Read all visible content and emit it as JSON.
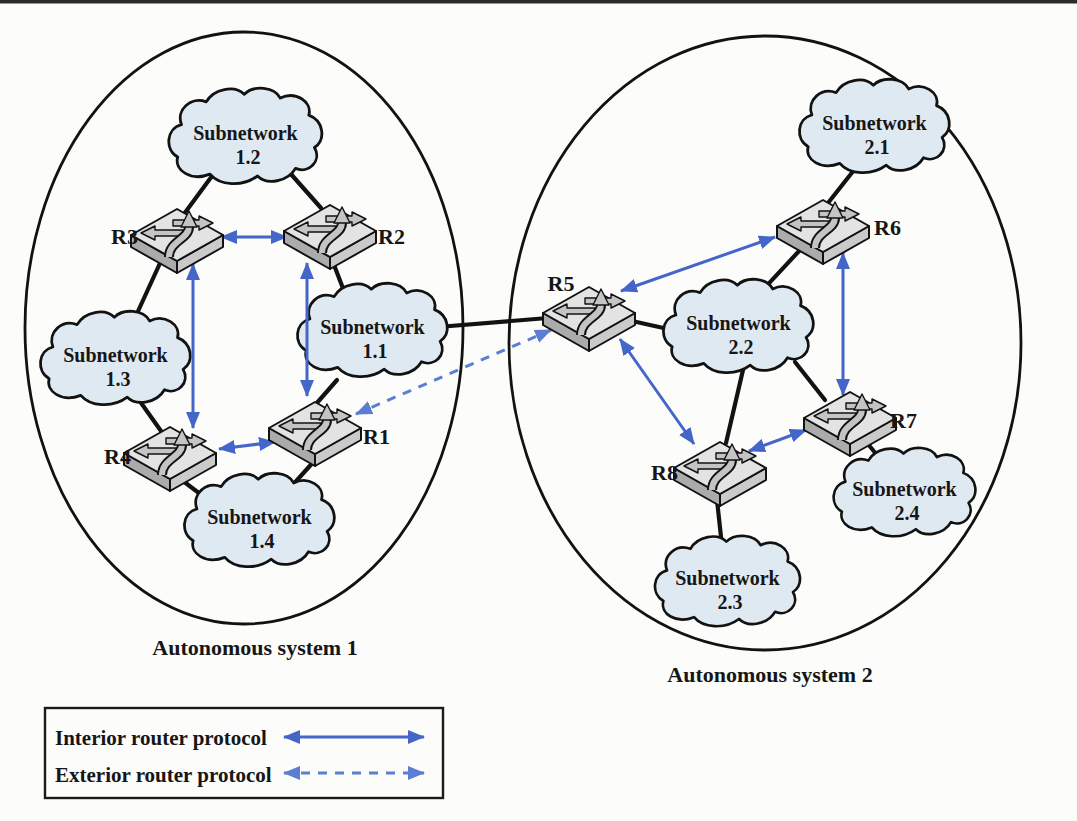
{
  "figure": {
    "type": "network-topology-diagram",
    "description_visible_only": "Two autonomous systems with routers, subnetworks and routing protocol arrows"
  },
  "autonomous_systems": [
    {
      "label": "Autonomous system 1"
    },
    {
      "label": "Autonomous system 2"
    }
  ],
  "routers": {
    "r1": "R1",
    "r2": "R2",
    "r3": "R3",
    "r4": "R4",
    "r5": "R5",
    "r6": "R6",
    "r7": "R7",
    "r8": "R8"
  },
  "subnetworks": {
    "s11": {
      "line1": "Subnetwork",
      "line2": "1.1"
    },
    "s12": {
      "line1": "Subnetwork",
      "line2": "1.2"
    },
    "s13": {
      "line1": "Subnetwork",
      "line2": "1.3"
    },
    "s14": {
      "line1": "Subnetwork",
      "line2": "1.4"
    },
    "s21": {
      "line1": "Subnetwork",
      "line2": "2.1"
    },
    "s22": {
      "line1": "Subnetwork",
      "line2": "2.2"
    },
    "s23": {
      "line1": "Subnetwork",
      "line2": "2.3"
    },
    "s24": {
      "line1": "Subnetwork",
      "line2": "2.4"
    }
  },
  "legend": {
    "items": [
      {
        "label": "Interior router protocol",
        "style": "solid-blue-double-arrow"
      },
      {
        "label": "Exterior router protocol",
        "style": "dashed-blue-double-arrow"
      }
    ]
  },
  "topology": {
    "interior_protocol_links": [
      "R3-R2",
      "R3-R4",
      "R2-R1",
      "R4-R1",
      "R5-R6",
      "R6-R7",
      "R5-R8",
      "R8-R7"
    ],
    "exterior_protocol_links": [
      "R1-R5"
    ],
    "subnetwork_attachments": {
      "1.1": [
        "R1",
        "R2",
        "R5"
      ],
      "1.2": [
        "R2",
        "R3"
      ],
      "1.3": [
        "R3",
        "R4"
      ],
      "1.4": [
        "R1",
        "R4"
      ],
      "2.1": [
        "R6"
      ],
      "2.2": [
        "R5",
        "R6",
        "R7",
        "R8"
      ],
      "2.3": [
        "R8"
      ],
      "2.4": [
        "R7"
      ]
    }
  },
  "colors": {
    "interior_arrow_blue": "#4466c8",
    "exterior_arrow_blue": "#5b7dd4",
    "cloud_fill": "#dfe9f2",
    "outline_black": "#121212",
    "router_top_gray": "#e3e3e3",
    "router_side_gray": "#ababab",
    "background": "#fcfcfa"
  }
}
